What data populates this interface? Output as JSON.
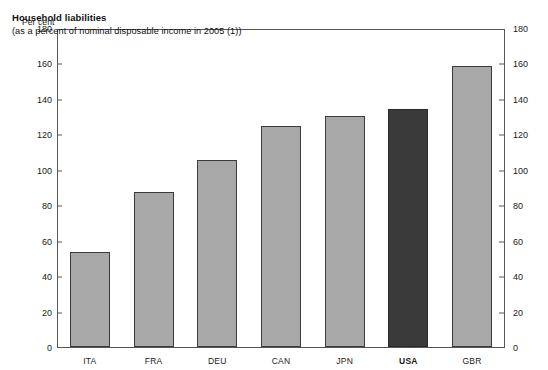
{
  "chart_data": {
    "type": "bar",
    "title": "Household liabilities",
    "subtitle": "(as a percent of nominal disposable income in 2005 (1))",
    "xlabel": "",
    "ylabel": "Per cent",
    "categories": [
      "ITA",
      "FRA",
      "DEU",
      "CAN",
      "JPN",
      "USA",
      "GBR"
    ],
    "values": [
      54,
      88,
      106,
      125,
      131,
      135,
      159
    ],
    "ylim": [
      0,
      180
    ],
    "yticks": [
      0,
      20,
      40,
      60,
      80,
      100,
      120,
      140,
      160,
      180
    ],
    "grid": false,
    "legend": "none",
    "highlight_category": "USA",
    "colors": {
      "bar": "#a8a8a8",
      "bar_outline": "#3b3b3b",
      "highlight_bar": "#3a3a3a",
      "axis": "#565656",
      "text": "#1a1a1a",
      "background": "#ffffff"
    }
  },
  "axes": {
    "unit_left": "Per cent",
    "tick_labels": [
      "180",
      "160",
      "140",
      "120",
      "100",
      "80",
      "60",
      "40",
      "20",
      "0"
    ]
  }
}
